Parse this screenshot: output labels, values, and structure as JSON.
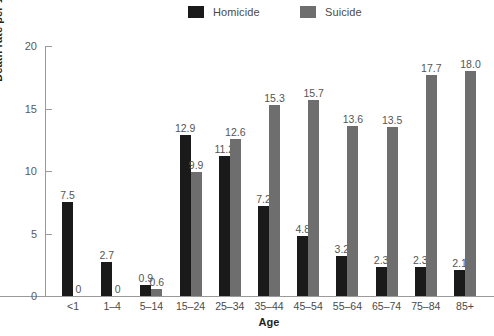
{
  "chart_data": {
    "type": "bar",
    "title": "",
    "xlabel": "Age",
    "ylabel": "Death rate per 100,000 population",
    "categories": [
      "<1",
      "1–4",
      "5–14",
      "15–24",
      "25–34",
      "35–44",
      "45–54",
      "55–64",
      "65–74",
      "75–84",
      "85+"
    ],
    "series": [
      {
        "name": "Homicide",
        "color": "#1a1a1a",
        "values": [
          7.5,
          2.7,
          0.9,
          12.9,
          11.2,
          7.2,
          4.8,
          3.2,
          2.3,
          2.3,
          2.1
        ],
        "labels": [
          "7.5",
          "2.7",
          "0.9",
          "12.9",
          "11.2",
          "7.2",
          "4.8",
          "3.2",
          "2.3",
          "2.3",
          "2.1"
        ]
      },
      {
        "name": "Suicide",
        "color": "#6e6e6e",
        "values": [
          0,
          0,
          0.6,
          9.9,
          12.6,
          15.3,
          15.7,
          13.6,
          13.5,
          17.7,
          18.0
        ],
        "labels": [
          "0",
          "0",
          "0.6",
          "9.9",
          "12.6",
          "15.3",
          "15.7",
          "13.6",
          "13.5",
          "17.7",
          "18.0"
        ]
      }
    ],
    "ylim": [
      0,
      20
    ],
    "yticks": [
      0,
      5,
      10,
      15,
      20
    ],
    "ytick_labels": [
      "0",
      "5",
      "10",
      "15",
      "20"
    ],
    "grid": false,
    "legend_position": "top-center"
  }
}
